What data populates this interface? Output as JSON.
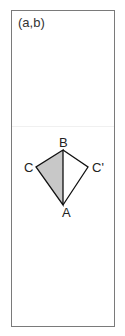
{
  "panel": {
    "label": "(a,b)"
  },
  "diagram": {
    "points": {
      "A": {
        "label": "A",
        "x": 63,
        "y": 205
      },
      "B": {
        "label": "B",
        "x": 63,
        "y": 150
      },
      "C": {
        "label": "C",
        "x": 36,
        "y": 167
      },
      "C_prime": {
        "label": "C'",
        "x": 88,
        "y": 167
      }
    },
    "shaded_triangle": [
      "B",
      "C",
      "A"
    ],
    "fill_color": "#c8c8c8",
    "stroke_color": "#111111"
  }
}
